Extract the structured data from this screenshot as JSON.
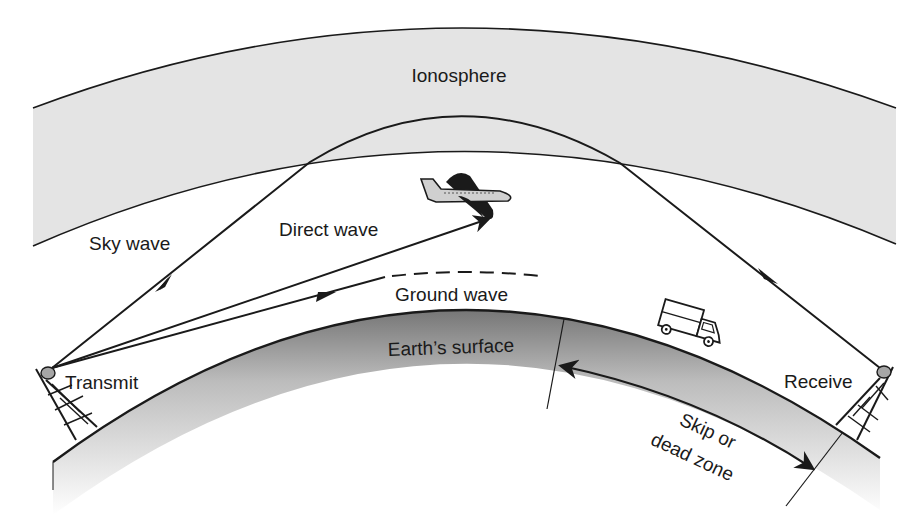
{
  "diagram": {
    "labels": {
      "ionosphere": "Ionosphere",
      "sky_wave": "Sky wave",
      "direct_wave": "Direct wave",
      "ground_wave": "Ground wave",
      "earth_surface": "Earth’s surface",
      "transmit": "Transmit",
      "receive": "Receive",
      "skip_zone_line1": "Skip or",
      "skip_zone_line2": "dead zone"
    },
    "objects": {
      "transmit_tower": "transmit-tower-icon",
      "receive_tower": "receive-tower-icon",
      "airplane": "airplane-icon",
      "truck": "truck-icon"
    },
    "colors": {
      "ionosphere_fill": "#e4e4e4",
      "stroke": "#1a1a1a",
      "earth_shadow": "#8a8a8a",
      "background": "#ffffff"
    }
  }
}
